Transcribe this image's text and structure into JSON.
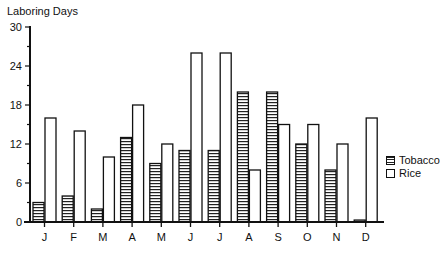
{
  "chart_data": {
    "type": "bar",
    "title": "",
    "xlabel": "",
    "ylabel": "Laboring Days",
    "ylim": [
      0,
      30
    ],
    "yticks": [
      0,
      6,
      12,
      18,
      24,
      30
    ],
    "grid": false,
    "legend_position": "right",
    "categories": [
      "J",
      "F",
      "M",
      "A",
      "M",
      "J",
      "J",
      "A",
      "S",
      "O",
      "N",
      "D"
    ],
    "series": [
      {
        "name": "Tobacco",
        "pattern": "horizontal-hatch",
        "values": [
          3,
          4,
          2,
          13,
          9,
          11,
          11,
          20,
          20,
          12,
          8,
          0.3
        ]
      },
      {
        "name": "Rice",
        "pattern": "white",
        "values": [
          16,
          14,
          10,
          18,
          12,
          26,
          26,
          8,
          15,
          15,
          12,
          16
        ]
      }
    ]
  },
  "legend": {
    "items": [
      {
        "label": "Tobacco"
      },
      {
        "label": "Rice"
      }
    ]
  }
}
